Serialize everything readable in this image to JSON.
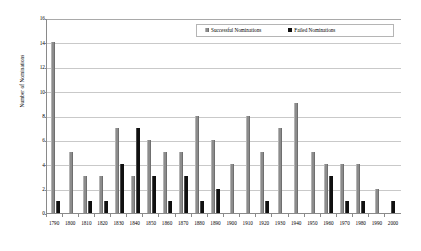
{
  "chart_data": {
    "type": "bar",
    "title": "",
    "xlabel": "",
    "ylabel": "Number of Nominations",
    "ylim": [
      0,
      16
    ],
    "ytick_step": 2,
    "yticks": [
      0,
      2,
      4,
      6,
      8,
      10,
      12,
      14,
      16
    ],
    "grid": true,
    "legend_position": "top-right",
    "categories": [
      "1790",
      "1800",
      "1810",
      "1820",
      "1830",
      "1840",
      "1850",
      "1860",
      "1870",
      "1880",
      "1890",
      "1900",
      "1910",
      "1920",
      "1930",
      "1940",
      "1950",
      "1960",
      "1970",
      "1980",
      "1990",
      "2000"
    ],
    "series": [
      {
        "name": "Successful Nominations",
        "color": "#8c8c8c",
        "values": [
          14,
          5,
          3,
          3,
          7,
          3,
          6,
          5,
          5,
          8,
          6,
          4,
          8,
          5,
          7,
          9,
          5,
          4,
          4,
          4,
          2,
          0
        ]
      },
      {
        "name": "Failed Nominations",
        "color": "#101010",
        "values": [
          1,
          0,
          1,
          1,
          4,
          7,
          3,
          1,
          3,
          1,
          2,
          0,
          0,
          1,
          0,
          0,
          0,
          3,
          1,
          1,
          0,
          1
        ]
      }
    ]
  },
  "legend": {
    "items": [
      {
        "label": "Successful Nominations",
        "swatch": "successful-swatch"
      },
      {
        "label": "Failed Nominations",
        "swatch": "failed-swatch"
      }
    ]
  },
  "axes": {
    "y_title": "Number of Nominations"
  }
}
